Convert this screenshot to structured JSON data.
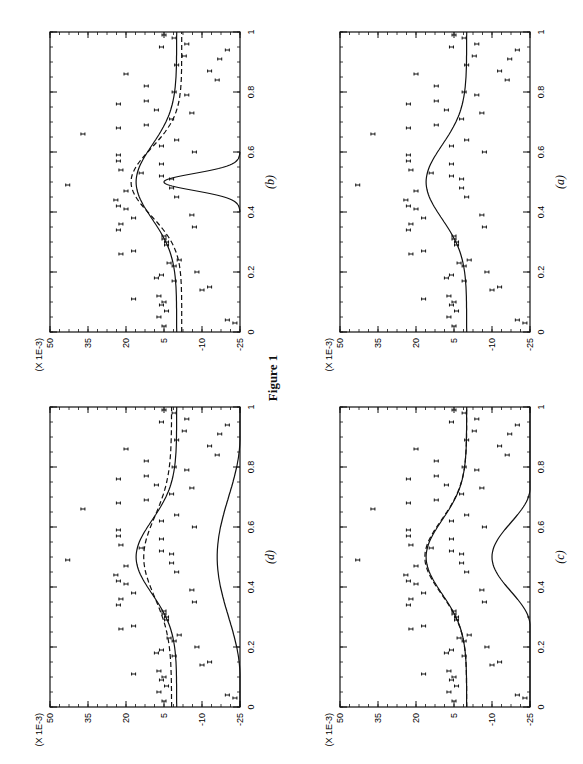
{
  "figure": {
    "caption": "Figure 1"
  },
  "axes": {
    "y_scale_label": "(X 1E-3)",
    "y_ticks": [
      50,
      35,
      20,
      5,
      -10,
      -25
    ],
    "x_ticks": [
      0,
      0.2,
      0.4,
      0.6,
      0.8,
      1
    ]
  },
  "chart_data": [
    {
      "type": "scatter",
      "panel": "(a)",
      "xlabel": "",
      "ylabel": "(X 1E-3)",
      "xlim": [
        0,
        1
      ],
      "ylim": [
        -25,
        50
      ],
      "series": [
        {
          "name": "data points",
          "kind": "points"
        },
        {
          "name": "fit (solid)",
          "kind": "line",
          "shape": "bump",
          "base": 0,
          "peak": 16,
          "center": 0.5,
          "width": 0.22
        }
      ]
    },
    {
      "type": "scatter",
      "panel": "(b)",
      "xlim": [
        0,
        1
      ],
      "ylim": [
        -25,
        50
      ],
      "series": [
        {
          "name": "data points",
          "kind": "points"
        },
        {
          "name": "fit (solid)",
          "kind": "line",
          "shape": "bump",
          "base": 0,
          "peak": 16,
          "center": 0.5,
          "width": 0.22
        },
        {
          "name": "fit (dashed)",
          "kind": "line-dashed",
          "shape": "bump",
          "base": -2,
          "peak": 18,
          "center": 0.5,
          "width": 0.2
        },
        {
          "name": "kernel (solid)",
          "kind": "line",
          "shape": "narrow-gaussian",
          "base": -25,
          "peak": 5,
          "center": 0.5,
          "support": [
            0.4,
            0.6
          ]
        }
      ]
    },
    {
      "type": "scatter",
      "panel": "(c)",
      "xlim": [
        0,
        1
      ],
      "ylim": [
        -25,
        50
      ],
      "series": [
        {
          "name": "data points",
          "kind": "points"
        },
        {
          "name": "fit (solid)",
          "kind": "line",
          "shape": "bump",
          "base": 0,
          "peak": 16,
          "center": 0.5,
          "width": 0.22
        },
        {
          "name": "fit (dashed)",
          "kind": "line-dashed",
          "shape": "bump",
          "base": 0,
          "peak": 16.5,
          "center": 0.5,
          "width": 0.22
        },
        {
          "name": "kernel (solid)",
          "kind": "line",
          "shape": "broad-bump",
          "base": -25,
          "peak": -10,
          "center": 0.5,
          "support": [
            0.27,
            0.73
          ]
        }
      ]
    },
    {
      "type": "scatter",
      "panel": "(d)",
      "xlim": [
        0,
        1
      ],
      "ylim": [
        -25,
        50
      ],
      "series": [
        {
          "name": "data points",
          "kind": "points"
        },
        {
          "name": "fit (solid)",
          "kind": "line",
          "shape": "bump",
          "base": 0,
          "peak": 16,
          "center": 0.5,
          "width": 0.22
        },
        {
          "name": "fit (dashed)",
          "kind": "line-dashed",
          "shape": "bump",
          "base": 2,
          "peak": 13,
          "center": 0.5,
          "width": 0.24
        },
        {
          "name": "kernel (solid)",
          "kind": "line",
          "shape": "broad-bump",
          "base": -25,
          "peak": -16,
          "center": 0.5,
          "support": [
            0.1,
            0.9
          ]
        }
      ]
    }
  ],
  "points": [
    [
      0.02,
      5
    ],
    [
      0.03,
      -23
    ],
    [
      0.04,
      -20
    ],
    [
      0.05,
      7
    ],
    [
      0.07,
      4
    ],
    [
      0.09,
      6
    ],
    [
      0.1,
      5
    ],
    [
      0.11,
      17
    ],
    [
      0.12,
      7
    ],
    [
      0.14,
      -10
    ],
    [
      0.15,
      -13
    ],
    [
      0.17,
      1
    ],
    [
      0.18,
      8
    ],
    [
      0.19,
      6
    ],
    [
      0.2,
      -8
    ],
    [
      0.22,
      1
    ],
    [
      0.23,
      3
    ],
    [
      0.24,
      -1
    ],
    [
      0.26,
      22
    ],
    [
      0.27,
      17
    ],
    [
      0.29,
      4
    ],
    [
      0.3,
      4
    ],
    [
      0.31,
      5
    ],
    [
      0.32,
      5
    ],
    [
      0.34,
      23
    ],
    [
      0.35,
      -7
    ],
    [
      0.36,
      22
    ],
    [
      0.38,
      17
    ],
    [
      0.39,
      -6
    ],
    [
      0.41,
      20
    ],
    [
      0.42,
      23
    ],
    [
      0.44,
      24
    ],
    [
      0.45,
      0
    ],
    [
      0.47,
      20
    ],
    [
      0.48,
      2
    ],
    [
      0.49,
      43
    ],
    [
      0.51,
      2
    ],
    [
      0.52,
      6
    ],
    [
      0.53,
      14
    ],
    [
      0.54,
      22
    ],
    [
      0.56,
      6
    ],
    [
      0.57,
      23
    ],
    [
      0.59,
      23
    ],
    [
      0.6,
      -7
    ],
    [
      0.62,
      6
    ],
    [
      0.64,
      0
    ],
    [
      0.66,
      37
    ],
    [
      0.68,
      23
    ],
    [
      0.69,
      12
    ],
    [
      0.71,
      2
    ],
    [
      0.73,
      -6
    ],
    [
      0.74,
      8
    ],
    [
      0.76,
      23
    ],
    [
      0.77,
      12
    ],
    [
      0.79,
      -4
    ],
    [
      0.8,
      1
    ],
    [
      0.82,
      12
    ],
    [
      0.84,
      -16
    ],
    [
      0.86,
      20
    ],
    [
      0.87,
      -13
    ],
    [
      0.89,
      0
    ],
    [
      0.91,
      -17
    ],
    [
      0.92,
      -3
    ],
    [
      0.94,
      -20
    ],
    [
      0.95,
      6
    ],
    [
      0.96,
      -4
    ],
    [
      0.98,
      1
    ],
    [
      0.99,
      5
    ]
  ]
}
